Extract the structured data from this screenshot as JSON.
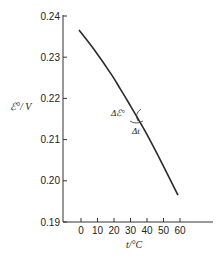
{
  "chart_data": {
    "type": "line",
    "title": "",
    "xlabel": "t/°C",
    "ylabel": "ℰ°/ V",
    "x_ticks": [
      "0",
      "10",
      "20",
      "30",
      "40",
      "50",
      "60"
    ],
    "y_ticks": [
      "0.19",
      "0.20",
      "0.21",
      "0.22",
      "0.23",
      "0.24"
    ],
    "xlim": [
      -10,
      80
    ],
    "ylim": [
      0.19,
      0.24
    ],
    "grid": false,
    "legend": null,
    "series": [
      {
        "name": "ℰ° vs t",
        "x": [
          0,
          10,
          20,
          25,
          30,
          40,
          50,
          60
        ],
        "y": [
          0.2366,
          0.2314,
          0.2256,
          0.2223,
          0.219,
          0.2121,
          0.2045,
          0.1965
        ]
      }
    ],
    "annotations": [
      {
        "text": "Δℰ°",
        "near_x": 32,
        "near_y": 0.2165
      },
      {
        "text": "Δt",
        "near_x": 36,
        "near_y": 0.2135
      }
    ]
  }
}
